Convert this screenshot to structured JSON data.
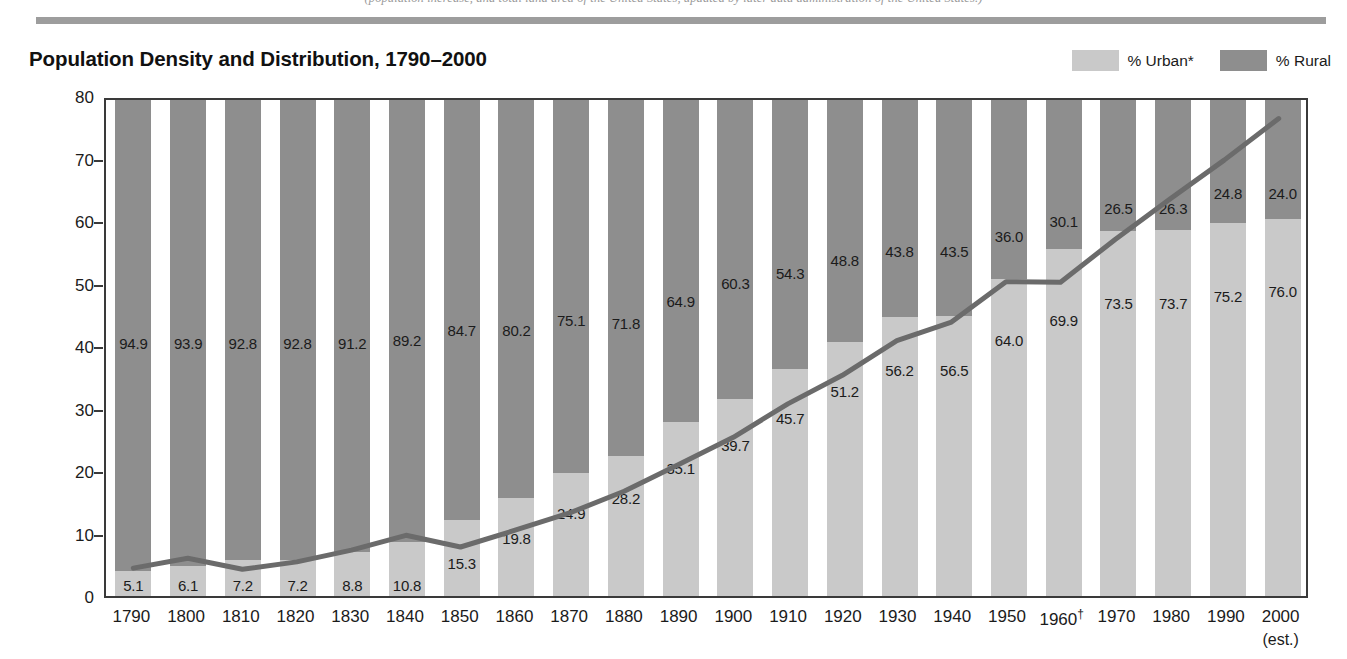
{
  "top_caption": "(population increase, and total land area of the United States, updated by later data administration of the United States.)",
  "header": {
    "title": "Population Density and Distribution, 1790–2000"
  },
  "legend": {
    "position": "top-right",
    "items": [
      {
        "label": "% Urban*",
        "color": "#c9c9c9",
        "key": "urban"
      },
      {
        "label": "% Rural",
        "color": "#8e8e8e",
        "key": "rural"
      }
    ]
  },
  "axes": {
    "ylabel": "Population per square mile",
    "yticks": [
      "0",
      "10",
      "20",
      "30",
      "40",
      "50",
      "60",
      "70",
      "80"
    ],
    "ylim": [
      0,
      80
    ],
    "xsub_note": "(est.)",
    "dagger": "†"
  },
  "chart_data": {
    "type": "bar",
    "title": "Population Density and Distribution, 1790–2000",
    "xlabel": "",
    "ylabel": "Population per square mile",
    "ylim": [
      0,
      80
    ],
    "grid": false,
    "legend_position": "top-right",
    "categories": [
      "1790",
      "1800",
      "1810",
      "1820",
      "1830",
      "1840",
      "1850",
      "1860",
      "1870",
      "1880",
      "1890",
      "1900",
      "1910",
      "1920",
      "1930",
      "1940",
      "1950",
      "1960†",
      "1970",
      "1980",
      "1990",
      "2000"
    ],
    "series": [
      {
        "name": "% Urban*",
        "type": "bar-segment",
        "color": "#c9c9c9",
        "values": [
          5.1,
          6.1,
          7.2,
          7.2,
          8.8,
          10.8,
          15.3,
          19.8,
          24.9,
          28.2,
          35.1,
          39.7,
          45.7,
          51.2,
          56.2,
          56.5,
          64.0,
          69.9,
          73.5,
          73.7,
          75.2,
          76.0
        ]
      },
      {
        "name": "% Rural",
        "type": "bar-segment",
        "color": "#8e8e8e",
        "values": [
          94.9,
          93.9,
          92.8,
          92.8,
          91.2,
          89.2,
          84.7,
          80.2,
          75.1,
          71.8,
          64.9,
          60.3,
          54.3,
          48.8,
          43.8,
          43.5,
          36.0,
          30.1,
          26.5,
          26.3,
          24.8,
          24.0
        ]
      },
      {
        "name": "Population per square mile",
        "type": "line",
        "color": "#6b6b6b",
        "values": [
          4.5,
          6.1,
          4.3,
          5.5,
          7.4,
          9.8,
          7.9,
          10.6,
          13.4,
          16.9,
          21.2,
          25.6,
          31.0,
          35.6,
          41.2,
          44.2,
          50.7,
          50.6,
          57.5,
          64.0,
          70.3,
          77.0
        ]
      }
    ]
  }
}
